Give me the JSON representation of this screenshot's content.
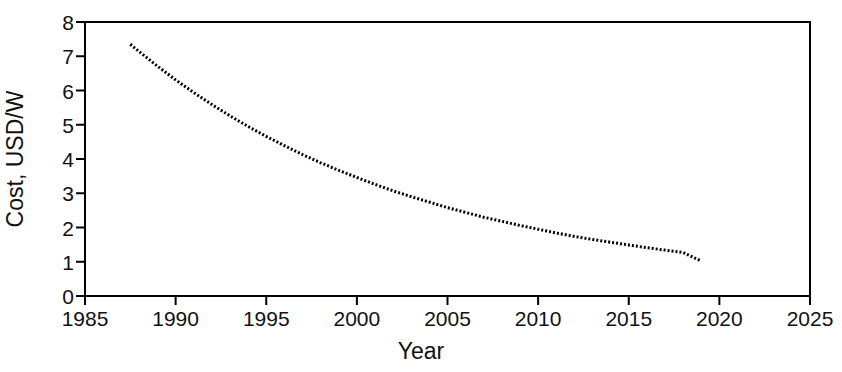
{
  "chart_data": {
    "type": "line",
    "title": "",
    "subtitle": "",
    "xlabel": "Year",
    "ylabel": "Cost, USD/W",
    "xlim": [
      1985,
      2025
    ],
    "ylim": [
      0,
      8
    ],
    "xticks": [
      1985,
      1990,
      1995,
      2000,
      2005,
      2010,
      2015,
      2020,
      2025
    ],
    "yticks": [
      0,
      1,
      2,
      3,
      4,
      5,
      6,
      7,
      8
    ],
    "xtick_labels": [
      "1985",
      "1990",
      "1995",
      "2000",
      "2005",
      "2010",
      "2015",
      "2020",
      "2025"
    ],
    "ytick_labels": [
      "0",
      "1",
      "2",
      "3",
      "4",
      "5",
      "6",
      "7",
      "8"
    ],
    "grid": false,
    "legend": false,
    "legend_position": "none",
    "line_style": "dotted",
    "line_color": "#000000",
    "series": [
      {
        "name": "Cost, USD/W",
        "x": [
          1987.5,
          1988,
          1989,
          1990,
          1991,
          1992,
          1993,
          1994,
          1995,
          1996,
          1997,
          1998,
          1999,
          2000,
          2001,
          2002,
          2003,
          2004,
          2005,
          2006,
          2007,
          2008,
          2009,
          2010,
          2011,
          2012,
          2013,
          2014,
          2015,
          2016,
          2017,
          2018,
          2019
        ],
        "values": [
          7.35,
          7.13,
          6.71,
          6.31,
          5.94,
          5.59,
          5.26,
          4.95,
          4.66,
          4.39,
          4.13,
          3.89,
          3.67,
          3.46,
          3.26,
          3.07,
          2.9,
          2.74,
          2.58,
          2.44,
          2.3,
          2.18,
          2.06,
          1.95,
          1.84,
          1.74,
          1.65,
          1.57,
          1.49,
          1.41,
          1.34,
          1.27,
          1.02
        ]
      }
    ],
    "annotations": []
  },
  "axes": {
    "x_title": "Year",
    "y_title": "Cost, USD/W"
  }
}
